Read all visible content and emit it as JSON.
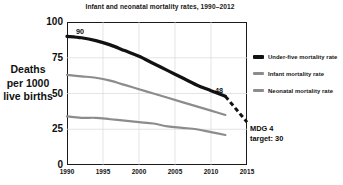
{
  "chart_data": {
    "type": "line",
    "title": "Infant and neonatal mortality rates, 1990–2012",
    "xlabel": "",
    "ylabel": "Deaths per 1000 live births",
    "ylabel_lines": [
      "Deaths",
      "per 1000",
      "live births"
    ],
    "xlim": [
      1990,
      2015
    ],
    "ylim": [
      0,
      100
    ],
    "grid": true,
    "legend_position": "right",
    "x_ticks": [
      "1990",
      "1995",
      "2000",
      "2005",
      "2010",
      "2015"
    ],
    "x_tick_values": [
      1990,
      1995,
      2000,
      2005,
      2010,
      2015
    ],
    "y_ticks": [
      "0",
      "25",
      "50",
      "75",
      "100"
    ],
    "y_tick_values": [
      0,
      25,
      50,
      75,
      100
    ],
    "x": [
      1990,
      1992,
      1994,
      1996,
      1998,
      2000,
      2002,
      2004,
      2006,
      2008,
      2010,
      2012
    ],
    "series": [
      {
        "name": "Under-five mortality rate",
        "color": "#111111",
        "width": 3.2,
        "style": "solid",
        "values": [
          90,
          89,
          87,
          84,
          80,
          76,
          71,
          66,
          61,
          56,
          52,
          48
        ]
      },
      {
        "name": "Infant mortality rate",
        "color": "#8c8c8c",
        "width": 2.2,
        "style": "solid",
        "values": [
          63,
          62,
          61,
          59,
          56,
          53,
          50,
          47,
          44,
          41,
          38,
          35
        ]
      },
      {
        "name": "Neonatal mortality rate",
        "color": "#8c8c8c",
        "width": 2.2,
        "style": "solid",
        "values": [
          34,
          33,
          33,
          32,
          31,
          30,
          29,
          27,
          26,
          25,
          23,
          21
        ]
      }
    ],
    "projection": {
      "name": "Under-five projection to MDG 4 target",
      "color": "#111111",
      "style": "dashed",
      "x": [
        2012,
        2015
      ],
      "values": [
        48,
        30
      ]
    },
    "annotations": [
      {
        "id": "start-value",
        "text": "90",
        "x": 1990,
        "y": 90
      },
      {
        "id": "end-value",
        "text": "48",
        "x": 2012,
        "y": 48
      },
      {
        "id": "mdg-target",
        "lines": [
          "MDG 4",
          "target: 30"
        ],
        "x": 2015,
        "y": 30
      }
    ]
  },
  "legend": {
    "items": [
      {
        "label": "Under-five mortality rate",
        "swatch": "thick-black-line"
      },
      {
        "label": "Infant mortality rate",
        "swatch": "gray-line"
      },
      {
        "label": "Neonatal mortality rate",
        "swatch": "gray-line"
      }
    ]
  },
  "annotations": {
    "start_value": "90",
    "end_value": "48",
    "target_line1": "MDG 4",
    "target_line2": "target: 30"
  },
  "colors": {
    "under_five": "#111111",
    "infant": "#8c8c8c",
    "neonatal": "#8c8c8c",
    "axis": "#1a1a1a",
    "grid": "#d8d8d8",
    "background": "#ffffff"
  }
}
